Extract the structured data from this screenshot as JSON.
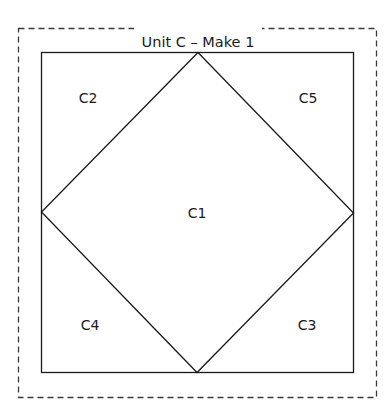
{
  "diagram": {
    "title": "Unit C – Make 1",
    "pieces": [
      {
        "id": "C1",
        "label": "C1",
        "shape": "diamond"
      },
      {
        "id": "C2",
        "label": "C2",
        "shape": "corner-triangle-top-left"
      },
      {
        "id": "C3",
        "label": "C3",
        "shape": "corner-triangle-bottom-right"
      },
      {
        "id": "C4",
        "label": "C4",
        "shape": "corner-triangle-bottom-left"
      },
      {
        "id": "C5",
        "label": "C5",
        "shape": "corner-triangle-top-right"
      }
    ],
    "colors": {
      "line": "#1a1a1a",
      "dashed_border": "#3a3a3a",
      "background": "#ffffff"
    }
  }
}
